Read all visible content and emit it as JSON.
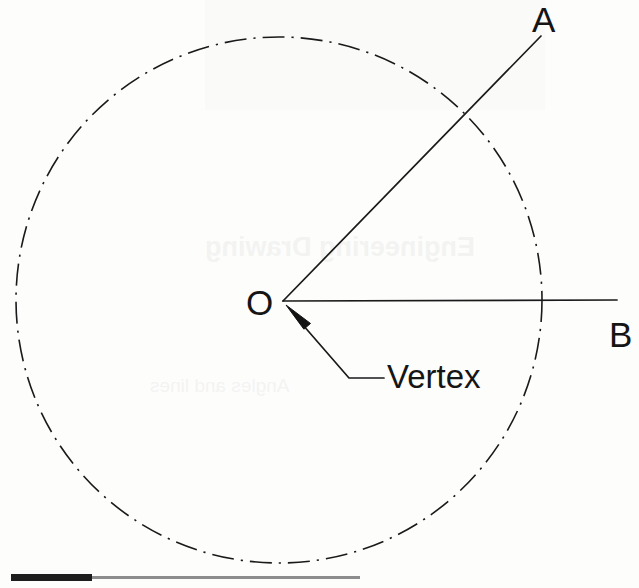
{
  "figure": {
    "background_color": "#fdfdfc",
    "stroke_color": "#1a1a1a",
    "width": 639,
    "height": 588
  },
  "labels": {
    "ray_a": "A",
    "ray_b": "B",
    "origin": "O",
    "vertex": "Vertex"
  },
  "geometry": {
    "circle": {
      "center_x": 279,
      "center_y": 300,
      "radius": 263,
      "line_style": "dash-dot",
      "stroke_width": 1.6
    },
    "vertex_point": {
      "x": 283,
      "y": 301
    },
    "ray_oa": {
      "x1": 283,
      "y1": 301,
      "x2": 541,
      "y2": 36
    },
    "ray_ob": {
      "x1": 283,
      "y1": 301,
      "x2": 617,
      "y2": 300
    },
    "leader_line": {
      "tip_x": 286,
      "tip_y": 305,
      "elbow_x": 349,
      "elbow_y": 378,
      "end_x": 384,
      "end_y": 378,
      "arrow": "filled-triangle"
    }
  },
  "scale_bar": {
    "fill_color": "#1d1d1d",
    "track_color": "#8d8d8d",
    "fill_width": 81,
    "total_width": 349
  }
}
